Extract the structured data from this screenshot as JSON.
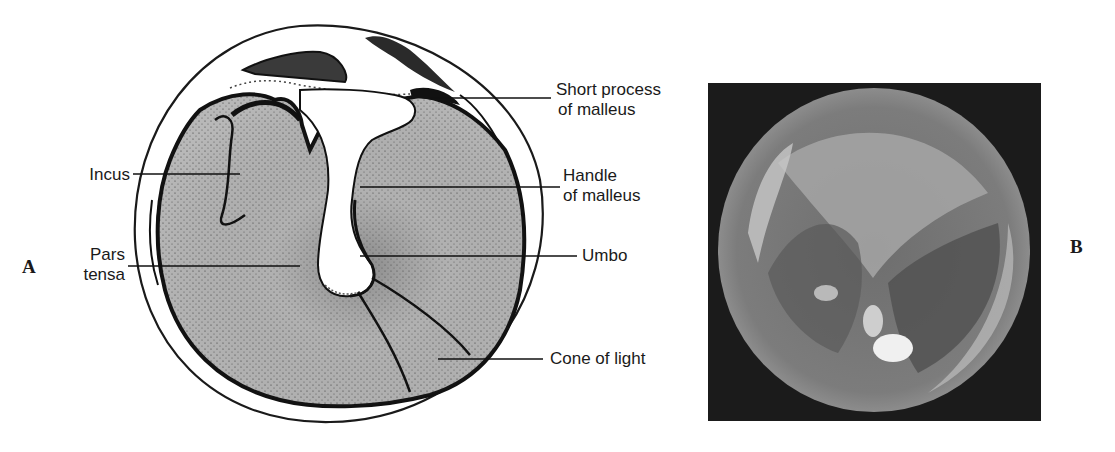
{
  "figure": {
    "panels": [
      {
        "letter": "A",
        "type": "labeled illustration of tympanic membrane",
        "labels": {
          "short_process": [
            "Short process",
            "of malleus"
          ],
          "incus": "Incus",
          "handle": [
            "Handle",
            "of malleus"
          ],
          "pars_tensa": [
            "Pars",
            "tensa"
          ],
          "umbo": "Umbo",
          "cone_of_light": "Cone of light"
        }
      },
      {
        "letter": "B",
        "type": "otoscopic photograph of tympanic membrane"
      }
    ]
  },
  "colors": {
    "ink": "#1a1a1a",
    "membrane_fill": "#b8b8b8",
    "photo_background": "#1b1b1b",
    "photo_membrane": "#8a8a8a"
  }
}
